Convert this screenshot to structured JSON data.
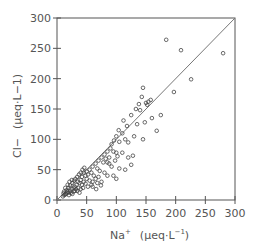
{
  "chart_data": {
    "type": "scatter",
    "title": "",
    "xlabel": "Na+ (μeq·L−1)",
    "ylabel": "Cl− (μeq·L−1)",
    "xlabel_parts": {
      "ion": "Na",
      "charge": "+",
      "unit": "(μeq·L",
      "exp": "−1",
      "close": ")"
    },
    "ylabel_parts": {
      "ion": "Cl",
      "charge": "−",
      "unit": "(μeq·L−1)"
    },
    "xlim": [
      0,
      300
    ],
    "ylim": [
      0,
      300
    ],
    "xticks": [
      0,
      50,
      100,
      150,
      200,
      250,
      300
    ],
    "yticks": [
      0,
      50,
      100,
      150,
      200,
      250,
      300
    ],
    "grid": false,
    "legend": null,
    "marker": "open-circle",
    "reference_line": {
      "label": "1:1 line",
      "from": [
        0,
        0
      ],
      "to": [
        300,
        300
      ]
    },
    "points": [
      [
        184,
        264
      ],
      [
        209,
        247
      ],
      [
        280,
        242
      ],
      [
        226,
        199
      ],
      [
        197,
        178
      ],
      [
        145,
        185
      ],
      [
        143,
        170
      ],
      [
        138,
        158
      ],
      [
        150,
        160
      ],
      [
        154,
        162
      ],
      [
        158,
        165
      ],
      [
        152,
        157
      ],
      [
        133,
        150
      ],
      [
        140,
        148
      ],
      [
        125,
        140
      ],
      [
        160,
        135
      ],
      [
        175,
        140
      ],
      [
        148,
        128
      ],
      [
        135,
        125
      ],
      [
        130,
        105
      ],
      [
        145,
        100
      ],
      [
        168,
        114
      ],
      [
        112,
        131
      ],
      [
        118,
        122
      ],
      [
        104,
        115
      ],
      [
        110,
        110
      ],
      [
        100,
        105
      ],
      [
        96,
        98
      ],
      [
        105,
        96
      ],
      [
        115,
        100
      ],
      [
        120,
        95
      ],
      [
        92,
        92
      ],
      [
        90,
        85
      ],
      [
        85,
        80
      ],
      [
        95,
        80
      ],
      [
        100,
        78
      ],
      [
        110,
        78
      ],
      [
        120,
        70
      ],
      [
        128,
        73
      ],
      [
        80,
        75
      ],
      [
        75,
        70
      ],
      [
        82,
        68
      ],
      [
        70,
        65
      ],
      [
        78,
        62
      ],
      [
        88,
        60
      ],
      [
        92,
        55
      ],
      [
        105,
        52
      ],
      [
        115,
        50
      ],
      [
        125,
        58
      ],
      [
        65,
        60
      ],
      [
        60,
        55
      ],
      [
        68,
        52
      ],
      [
        72,
        48
      ],
      [
        80,
        45
      ],
      [
        85,
        40
      ],
      [
        95,
        40
      ],
      [
        100,
        35
      ],
      [
        62,
        40
      ],
      [
        55,
        50
      ],
      [
        50,
        47
      ],
      [
        58,
        45
      ],
      [
        52,
        42
      ],
      [
        48,
        40
      ],
      [
        45,
        45
      ],
      [
        42,
        38
      ],
      [
        50,
        35
      ],
      [
        55,
        32
      ],
      [
        60,
        30
      ],
      [
        65,
        35
      ],
      [
        70,
        38
      ],
      [
        75,
        30
      ],
      [
        45,
        30
      ],
      [
        40,
        33
      ],
      [
        38,
        28
      ],
      [
        35,
        30
      ],
      [
        42,
        25
      ],
      [
        48,
        27
      ],
      [
        52,
        22
      ],
      [
        58,
        25
      ],
      [
        33,
        25
      ],
      [
        30,
        22
      ],
      [
        28,
        20
      ],
      [
        32,
        18
      ],
      [
        36,
        20
      ],
      [
        40,
        18
      ],
      [
        44,
        20
      ],
      [
        25,
        18
      ],
      [
        22,
        15
      ],
      [
        20,
        12
      ],
      [
        18,
        14
      ],
      [
        24,
        12
      ],
      [
        28,
        14
      ],
      [
        30,
        15
      ],
      [
        15,
        10
      ],
      [
        17,
        12
      ],
      [
        12,
        8
      ],
      [
        14,
        9
      ],
      [
        20,
        8
      ],
      [
        10,
        6
      ],
      [
        26,
        10
      ],
      [
        34,
        15
      ],
      [
        38,
        12
      ],
      [
        16,
        16
      ],
      [
        19,
        20
      ],
      [
        22,
        24
      ],
      [
        26,
        28
      ],
      [
        29,
        32
      ],
      [
        31,
        35
      ],
      [
        34,
        38
      ],
      [
        37,
        42
      ],
      [
        40,
        45
      ],
      [
        43,
        50
      ],
      [
        46,
        53
      ],
      [
        18,
        25
      ],
      [
        14,
        20
      ],
      [
        21,
        30
      ],
      [
        25,
        33
      ],
      [
        12,
        14
      ],
      [
        11,
        11
      ],
      [
        60,
        22
      ],
      [
        68,
        28
      ],
      [
        74,
        24
      ],
      [
        66,
        18
      ],
      [
        85,
        62
      ],
      [
        88,
        70
      ],
      [
        98,
        65
      ],
      [
        102,
        72
      ]
    ]
  },
  "plot_area": {
    "px_left": 57,
    "px_right": 235,
    "px_top": 18,
    "px_bottom": 200
  },
  "colors": {
    "axis": "#555555",
    "marker": "#444444",
    "line": "#777777",
    "text": "#555555"
  }
}
